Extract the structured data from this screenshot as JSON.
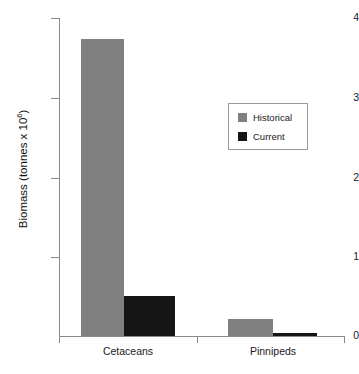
{
  "chart_data": {
    "type": "bar",
    "title": "",
    "xlabel": "",
    "ylabel": "Biomass (tonnes x 10",
    "ylabel_exponent": "6",
    "ylabel_suffix": ")",
    "categories": [
      "Cetaceans",
      "Pinnipeds"
    ],
    "series": [
      {
        "name": "Historical",
        "color": "#808080",
        "values": [
          3.73,
          0.21
        ]
      },
      {
        "name": "Current",
        "color": "#151515",
        "values": [
          0.5,
          0.04
        ]
      }
    ],
    "ylim": [
      0,
      4
    ],
    "yticks": [
      0,
      1,
      2,
      3,
      4
    ],
    "ytick_labels": [
      "0",
      "1",
      "2",
      "3",
      "4"
    ],
    "grid": false,
    "legend_position": "upper-right",
    "axis_color": "#8a8a8a"
  },
  "legend": {
    "entries": [
      {
        "label": "Historical"
      },
      {
        "label": "Current"
      }
    ]
  }
}
